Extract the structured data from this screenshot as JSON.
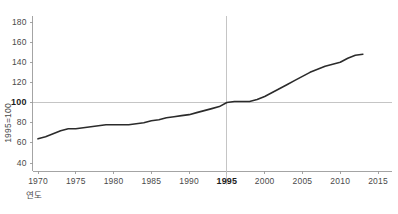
{
  "chart_data": {
    "type": "line",
    "title": "",
    "subtitle": "",
    "xlabel": "연도",
    "ylabel": "1995=100",
    "xlim": [
      1968.5,
      2016.5
    ],
    "ylim": [
      30,
      188
    ],
    "grid": false,
    "legend_position": "none",
    "reference_lines": [
      {
        "axis": "y",
        "value": 100,
        "label": "100",
        "emphasis": true
      },
      {
        "axis": "x",
        "value": 1995,
        "label": "1995",
        "emphasis": true
      }
    ],
    "yticks": [
      40,
      60,
      80,
      100,
      120,
      140,
      160,
      180
    ],
    "ytick_labels": [
      "40",
      "60",
      "80",
      "100",
      "120",
      "140",
      "160",
      "180"
    ],
    "ytick_emphasis": [
      false,
      false,
      false,
      true,
      false,
      false,
      false,
      false
    ],
    "xticks": [
      1970,
      1975,
      1980,
      1985,
      1990,
      1995,
      2000,
      2005,
      2010,
      2015
    ],
    "xtick_labels": [
      "1970",
      "1975",
      "1980",
      "1985",
      "1990",
      "1995",
      "2000",
      "2005",
      "2010",
      "2015"
    ],
    "xtick_emphasis": [
      false,
      false,
      false,
      false,
      false,
      true,
      false,
      false,
      false,
      false
    ],
    "series": [
      {
        "name": "index",
        "color": "#2b2b2b",
        "line_width": 1.6,
        "x": [
          1970,
          1971,
          1972,
          1973,
          1974,
          1975,
          1976,
          1977,
          1978,
          1979,
          1980,
          1981,
          1982,
          1983,
          1984,
          1985,
          1986,
          1987,
          1988,
          1989,
          1990,
          1991,
          1992,
          1993,
          1994,
          1995,
          1996,
          1997,
          1998,
          1999,
          2000,
          2001,
          2002,
          2003,
          2004,
          2005,
          2006,
          2007,
          2008,
          2009,
          2010,
          2011,
          2012,
          2013
        ],
        "values": [
          64,
          66,
          69,
          72,
          74,
          74,
          75,
          76,
          77,
          78,
          78,
          78,
          78,
          79,
          80,
          82,
          83,
          85,
          86,
          87,
          88,
          90,
          92,
          94,
          96,
          100,
          101,
          101,
          101,
          103,
          106,
          110,
          114,
          118,
          122,
          126,
          130,
          133,
          136,
          138,
          140,
          144,
          147,
          148
        ]
      }
    ],
    "axis_color": "#9a9a9a",
    "reference_line_color": "#bfbfbf",
    "text_color": "#4a4a4a",
    "background": "#ffffff"
  }
}
